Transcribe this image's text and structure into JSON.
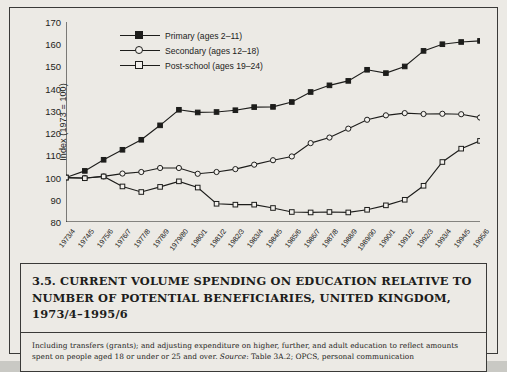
{
  "chart_data": {
    "type": "line",
    "title": "Current volume spending on education relative to number of potential beneficiaries, United Kingdom, 1973/4–1995/6",
    "xlabel": "",
    "ylabel": "Index (1973 = 100)",
    "ylim": [
      80,
      170
    ],
    "yticks": [
      80,
      90,
      100,
      110,
      120,
      130,
      140,
      150,
      160,
      170
    ],
    "grid": false,
    "legend_position": "top-left",
    "categories": [
      "1973/4",
      "1974/5",
      "1975/6",
      "1976/7",
      "1977/8",
      "1978/9",
      "1979/80",
      "1980/1",
      "1981/2",
      "1982/3",
      "1983/4",
      "1984/5",
      "1985/6",
      "1986/7",
      "1987/8",
      "1988/9",
      "1989/90",
      "1990/1",
      "1991/2",
      "1992/3",
      "1993/4",
      "1994/5",
      "1995/6"
    ],
    "series": [
      {
        "name": "Primary (ages 2–11)",
        "marker": "filled-square",
        "values": [
          100,
          103,
          108,
          112.5,
          117,
          123.5,
          130.5,
          129.3,
          129.5,
          130.3,
          131.7,
          131.8,
          134,
          138.5,
          141.5,
          143.5,
          148.5,
          147,
          150,
          157,
          160,
          161,
          161.5
        ]
      },
      {
        "name": "Secondary (ages 12–18)",
        "marker": "open-circle",
        "values": [
          100,
          99.8,
          100.5,
          101.8,
          102.5,
          104.3,
          104.3,
          101.7,
          102.5,
          103.8,
          105.8,
          107.8,
          109.5,
          115.5,
          118,
          122,
          126,
          128,
          129,
          128.6,
          128.7,
          128.5,
          127
        ]
      },
      {
        "name": "Post-school (ages 19–24)",
        "marker": "open-square",
        "values": [
          100,
          99.7,
          100.5,
          96,
          93.5,
          95.8,
          98.3,
          95.5,
          88.2,
          87.8,
          87.8,
          86.3,
          84.5,
          84.3,
          84.5,
          84.3,
          85.5,
          87.5,
          90,
          96.3,
          107,
          113,
          116.5
        ]
      }
    ]
  },
  "legend": {
    "items": [
      {
        "label": "Primary (ages 2–11)",
        "marker": "filled-square"
      },
      {
        "label": "Secondary (ages 12–18)",
        "marker": "open-circle"
      },
      {
        "label": "Post-school (ages 19–24)",
        "marker": "open-square"
      }
    ]
  },
  "caption": {
    "number": "3.5.",
    "title": "CURRENT VOLUME SPENDING ON EDUCATION RELATIVE TO NUMBER OF POTENTIAL BENEFICIARIES, UNITED KINGDOM, 1973/4–1995/6",
    "note_before": "Including transfers (grants); and adjusting expenditure on higher, further, and adult education to reflect amounts spent on people aged 18 or under or 25 and over. ",
    "note_source_label": "Source",
    "note_after": ": Table 3A.2; OPCS, personal communication"
  },
  "colors": {
    "ink": "#1d1d1b",
    "page": "#eceae5",
    "marker_fill": "#f2f0ec",
    "outer": "#c9c9c4"
  }
}
